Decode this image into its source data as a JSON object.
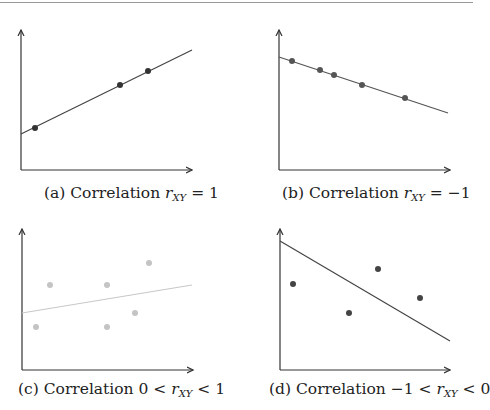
{
  "chart_data": [
    {
      "type": "scatter",
      "panel": "a",
      "title": "(a) Correlation r_XY = 1",
      "caption_prefix": "(a) Correlation ",
      "caption_rel": " = 1",
      "axes": {
        "origin_px": [
          21,
          170
        ],
        "x_end_px": 192,
        "y_top_px": 30
      },
      "fit_line": {
        "from": [
          21,
          134
        ],
        "to": [
          192,
          50
        ],
        "color": "#444444"
      },
      "points": [
        [
          35,
          128
        ],
        [
          120,
          85
        ],
        [
          148,
          71
        ]
      ],
      "point_color": "#333333",
      "grid": false
    },
    {
      "type": "scatter",
      "panel": "b",
      "title": "(b) Correlation r_XY = -1",
      "caption_prefix": "(b) Correlation ",
      "caption_rel": " = −1",
      "axes": {
        "origin_px": [
          279,
          170
        ],
        "x_end_px": 450,
        "y_top_px": 30
      },
      "fit_line": {
        "from": [
          279,
          57
        ],
        "to": [
          448,
          113
        ],
        "color": "#555555"
      },
      "points": [
        [
          292,
          61
        ],
        [
          320,
          70
        ],
        [
          334,
          75
        ],
        [
          362,
          85
        ],
        [
          405,
          98
        ]
      ],
      "point_color": "#555555",
      "grid": false
    },
    {
      "type": "scatter",
      "panel": "c",
      "title": "(c) Correlation 0 < r_XY < 1",
      "caption_prefix": "(c) Correlation 0 < ",
      "caption_rel": " < 1",
      "axes": {
        "origin_px": [
          22,
          370
        ],
        "x_end_px": 193,
        "y_top_px": 229
      },
      "fit_line": {
        "from": [
          22,
          313
        ],
        "to": [
          192,
          285
        ],
        "color": "#c8c8c8"
      },
      "points": [
        [
          36,
          327
        ],
        [
          50,
          285
        ],
        [
          107,
          285
        ],
        [
          107,
          327
        ],
        [
          135,
          313
        ],
        [
          149,
          263
        ]
      ],
      "point_color": "#c4c4c4",
      "grid": false
    },
    {
      "type": "scatter",
      "panel": "d",
      "title": "(d) Correlation -1 < r_XY < 0",
      "caption_prefix": "(d) Correlation −1 < ",
      "caption_rel": " < 0",
      "axes": {
        "origin_px": [
          280,
          370
        ],
        "x_end_px": 450,
        "y_top_px": 229
      },
      "fit_line": {
        "from": [
          280,
          241
        ],
        "to": [
          450,
          341
        ],
        "color": "#444444"
      },
      "points": [
        [
          293,
          284
        ],
        [
          349,
          313
        ],
        [
          378,
          269
        ],
        [
          420,
          298
        ]
      ],
      "point_color": "#444444",
      "grid": false
    }
  ],
  "captions": {
    "a": {
      "prefix": "(a) Correlation ",
      "var": "r",
      "sub": "XY",
      "rel": " = 1"
    },
    "b": {
      "prefix": "(b) Correlation ",
      "var": "r",
      "sub": "XY",
      "rel": " = −1"
    },
    "c": {
      "prefix": "(c) Correlation 0 < ",
      "var": "r",
      "sub": "XY",
      "rel": " < 1"
    },
    "d": {
      "prefix": "(d) Correlation −1 < ",
      "var": "r",
      "sub": "XY",
      "rel": " < 0"
    }
  }
}
